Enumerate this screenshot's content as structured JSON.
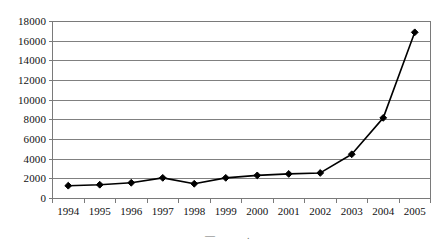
{
  "chart_data": {
    "type": "line",
    "title": "",
    "subtitle": "",
    "xlabel": "",
    "ylabel": "",
    "categories": [
      "1994",
      "1995",
      "1996",
      "1997",
      "1998",
      "1999",
      "2000",
      "2001",
      "2002",
      "2003",
      "2004",
      "2005"
    ],
    "values": [
      1300,
      1400,
      1600,
      2100,
      1500,
      2100,
      2350,
      2500,
      2600,
      4500,
      8200,
      16900
    ],
    "series": [
      {
        "name": "",
        "values": [
          1300,
          1400,
          1600,
          2100,
          1500,
          2100,
          2350,
          2500,
          2600,
          4500,
          8200,
          16900
        ]
      }
    ],
    "ylim": [
      0,
      18000
    ],
    "yticks": [
      0,
      2000,
      4000,
      6000,
      8000,
      10000,
      12000,
      14000,
      16000,
      18000
    ],
    "ytick_labels": [
      "0",
      "2000",
      "4000",
      "6000",
      "8000",
      "10000",
      "12000",
      "14000",
      "16000",
      "18000"
    ],
    "grid": "horizontal",
    "legend": "none",
    "marker": "diamond",
    "line_color": "#000000",
    "marker_color": "#000000",
    "grid_color": "#808080",
    "axis_color": "#7a7a7a",
    "plot_background": "#ffffff"
  },
  "footer": {
    "fragment_left": "—",
    "fragment_right": "."
  }
}
